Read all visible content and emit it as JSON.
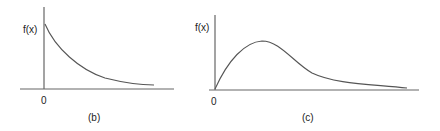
{
  "figures": [
    {
      "id": "b",
      "caption": "(b)",
      "ylabel": "f(x)",
      "origin_label": "0",
      "description": "Monotonically decreasing curve starting high at x=0 and decaying toward the x-axis",
      "axis": {
        "x_line": [
          20,
          89,
          174,
          89
        ],
        "y_line": [
          44,
          7,
          44,
          89
        ]
      },
      "curve_path": "M45,24 C55,48 80,70 105,78 C125,83 140,85 154,85"
    },
    {
      "id": "c",
      "caption": "(c)",
      "ylabel": "f(x)",
      "origin_label": "0",
      "description": "Right-skewed unimodal curve starting at origin, peaking early then with a long tail",
      "axis": {
        "x_line": [
          209,
          90,
          419,
          90
        ],
        "y_line": [
          215,
          15,
          215,
          90
        ]
      },
      "curve_path": "M215,89 C228,60 245,42 262,41 C280,41 293,62 312,73 C335,84 370,84 407,88"
    }
  ],
  "colors": {
    "stroke": "#555555",
    "axis": "#666666",
    "text": "#222222"
  }
}
